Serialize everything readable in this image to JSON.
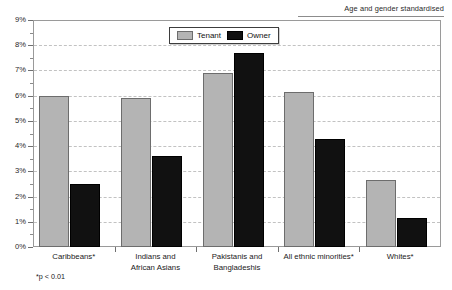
{
  "chart_data": {
    "type": "bar",
    "title": "",
    "annotation": "Age and gender standardised",
    "footnote": "*p < 0.01",
    "xlabel": "",
    "ylabel": "",
    "ylim": [
      0,
      9
    ],
    "ytick_labels": [
      "0%",
      "1%",
      "2%",
      "3%",
      "4%",
      "5%",
      "6%",
      "7%",
      "8%",
      "9%"
    ],
    "ytick_values": [
      0,
      1,
      2,
      3,
      4,
      5,
      6,
      7,
      8,
      9
    ],
    "grid": true,
    "legend_position": "top-center",
    "categories": [
      "Caribbeans*",
      "Indians and\nAfrican Asians",
      "Pakistanis and\nBangladeshis",
      "All ethnic minorities*",
      "Whites*"
    ],
    "series": [
      {
        "name": "Tenant",
        "color": "#b4b4b4",
        "values": [
          6.0,
          5.9,
          6.9,
          6.15,
          2.65
        ]
      },
      {
        "name": "Owner",
        "color": "#111111",
        "values": [
          2.5,
          3.6,
          7.7,
          4.3,
          1.15
        ]
      }
    ]
  },
  "legend": {
    "items": [
      {
        "label": "Tenant",
        "swatch": "tenant"
      },
      {
        "label": "Owner",
        "swatch": "owner"
      }
    ]
  }
}
